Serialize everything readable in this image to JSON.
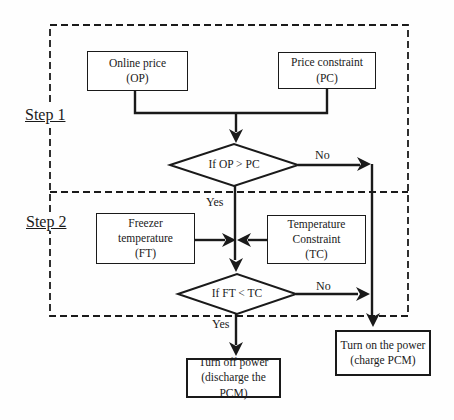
{
  "diagram": {
    "step1_label": "Step 1",
    "step2_label": "Step 2",
    "boxes": {
      "online_price": {
        "line1": "Online price",
        "line2": "(OP)"
      },
      "price_constraint": {
        "line1": "Price constraint",
        "line2": "(PC)"
      },
      "freezer_temperature": {
        "line1": "Freezer",
        "line2": "temperature",
        "line3": "(FT)"
      },
      "temperature_constraint": {
        "line1": "Temperature",
        "line2": "Constraint",
        "line3": "(TC)"
      },
      "turn_off_power": {
        "line1": "Turn off power",
        "line2": "(discharge the PCM)"
      },
      "turn_on_power": {
        "line1": "Turn on the power",
        "line2": "(charge PCM)"
      }
    },
    "decisions": {
      "price": "If OP > PC",
      "temperature": "If FT < TC"
    },
    "edge_labels": {
      "price_no": "No",
      "price_yes": "Yes",
      "temperature_no": "No",
      "temperature_yes": "Yes"
    },
    "colors": {
      "line": "#1a1a1a",
      "background": "#ffffff"
    }
  }
}
